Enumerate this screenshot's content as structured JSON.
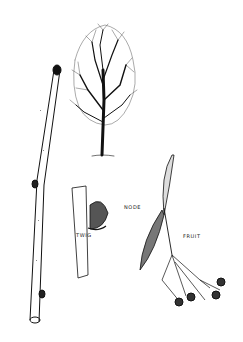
{
  "illustration": {
    "subject": "Botanical line drawing of a tree with twig, node and fruit details",
    "labels": {
      "twig": "TWIG",
      "node": "NODE",
      "fruit": "FRUIT"
    },
    "colors": {
      "ink": "#111111",
      "paper": "#ffffff"
    }
  }
}
